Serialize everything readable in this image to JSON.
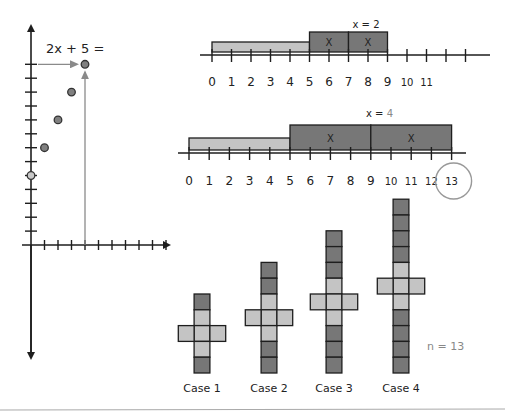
{
  "colors": {
    "light": "#c4c4c4",
    "dark": "#777777",
    "stroke": "#1e1e1e",
    "accent_grey": "#8a8a8a",
    "point_fill": "#808080",
    "intercept_fill": "#c8c8c8"
  },
  "graph": {
    "expression": "2x + 5 =",
    "x_ticks_right": 10,
    "y_ticks_up": 13,
    "points": [
      {
        "x": 0,
        "y": 5,
        "style": "intercept"
      },
      {
        "x": 1,
        "y": 7,
        "style": "dark"
      },
      {
        "x": 2,
        "y": 9,
        "style": "dark"
      },
      {
        "x": 3,
        "y": 11,
        "style": "dark"
      },
      {
        "x": 4,
        "y": 13,
        "style": "dark"
      }
    ],
    "highlight": {
      "x": 4,
      "y": 13
    }
  },
  "number_line_1": {
    "title": "x = 2",
    "labels": [
      "0",
      "1",
      "2",
      "3",
      "4",
      "5",
      "6",
      "7",
      "8",
      "9",
      "10",
      "11"
    ],
    "constant_bar": {
      "from": 0,
      "to": 5
    },
    "x_bars": [
      {
        "from": 5,
        "to": 7,
        "label": "X"
      },
      {
        "from": 7,
        "to": 9,
        "label": "X"
      }
    ]
  },
  "number_line_2": {
    "title_prefix": "x = ",
    "title_value": "4",
    "labels": [
      "0",
      "1",
      "2",
      "3",
      "4",
      "5",
      "6",
      "7",
      "8",
      "9",
      "10",
      "11",
      "12",
      "13"
    ],
    "circled_label": "13",
    "constant_bar": {
      "from": 0,
      "to": 5
    },
    "x_bars": [
      {
        "from": 5,
        "to": 9,
        "label": "X"
      },
      {
        "from": 9,
        "to": 13,
        "label": "X"
      }
    ]
  },
  "cases": [
    {
      "label": "Case 1",
      "n": 1
    },
    {
      "label": "Case 2",
      "n": 2
    },
    {
      "label": "Case 3",
      "n": 3
    },
    {
      "label": "Case 4",
      "n": 4
    }
  ],
  "result_label": "n = 13"
}
